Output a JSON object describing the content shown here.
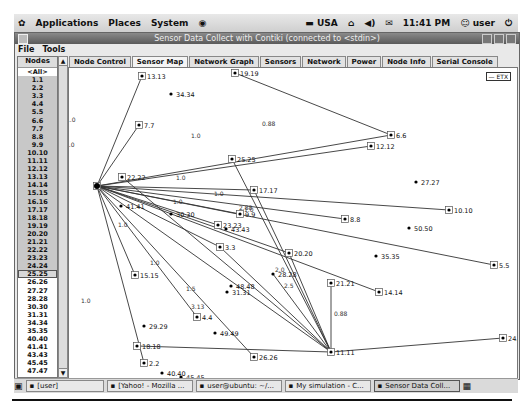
{
  "panel": {
    "menus": [
      "Applications",
      "Places",
      "System"
    ],
    "keyboard": "USA",
    "clock": "11:41 PM",
    "user": "user"
  },
  "window": {
    "title": "Sensor Data Collect with Contiki (connected to <stdin>)",
    "menu": [
      "File",
      "Tools"
    ]
  },
  "nodes": {
    "header": "Nodes",
    "items": [
      "<All>",
      "1.1",
      "2.2",
      "3.3",
      "4.4",
      "5.5",
      "6.6",
      "7.7",
      "8.8",
      "9.9",
      "10.10",
      "11.11",
      "12.12",
      "13.13",
      "14.14",
      "15.15",
      "16.16",
      "17.17",
      "18.18",
      "19.19",
      "20.20",
      "21.21",
      "22.22",
      "23.23",
      "24.24",
      "25.25",
      "26.26",
      "27.27",
      "28.28",
      "30.30",
      "31.31",
      "34.34",
      "35.35",
      "40.40",
      "41.41",
      "43.43",
      "45.45",
      "47.47"
    ],
    "selected_range": "1.1-24.24",
    "focused": "25.25"
  },
  "tabs": [
    "Node Control",
    "Sensor Map",
    "Network Graph",
    "Sensors",
    "Network",
    "Power",
    "Node Info",
    "Serial Console"
  ],
  "active_tab": "Sensor Map",
  "map": {
    "legend": "— ETX",
    "sink": "16.16",
    "nodes": [
      {
        "id": "13.13",
        "x": 73,
        "y": 8,
        "boxed": true
      },
      {
        "id": "19.19",
        "x": 166,
        "y": 5,
        "boxed": true
      },
      {
        "id": "34.34",
        "x": 102,
        "y": 26,
        "boxed": false
      },
      {
        "id": "7.7",
        "x": 70,
        "y": 57,
        "boxed": true
      },
      {
        "id": "6.6",
        "x": 322,
        "y": 67,
        "boxed": true
      },
      {
        "id": "12.12",
        "x": 302,
        "y": 78,
        "boxed": true
      },
      {
        "id": "25.25",
        "x": 163,
        "y": 91,
        "boxed": true
      },
      {
        "id": "22.22",
        "x": 53,
        "y": 109,
        "boxed": true
      },
      {
        "id": "16.16",
        "x": 28,
        "y": 118,
        "boxed": true
      },
      {
        "id": "27.27",
        "x": 347,
        "y": 114,
        "boxed": false
      },
      {
        "id": "17.17",
        "x": 185,
        "y": 122,
        "boxed": true
      },
      {
        "id": "10.10",
        "x": 380,
        "y": 142,
        "boxed": true
      },
      {
        "id": "41.41",
        "x": 52,
        "y": 138,
        "boxed": false
      },
      {
        "id": "30.30",
        "x": 102,
        "y": 146,
        "boxed": false
      },
      {
        "id": "9.9",
        "x": 171,
        "y": 146,
        "boxed": true
      },
      {
        "id": "8.8",
        "x": 276,
        "y": 151,
        "boxed": true
      },
      {
        "id": "23.23",
        "x": 149,
        "y": 157,
        "boxed": true
      },
      {
        "id": "43.43",
        "x": 157,
        "y": 161,
        "boxed": false
      },
      {
        "id": "50.50",
        "x": 340,
        "y": 160,
        "boxed": false
      },
      {
        "id": "3.3",
        "x": 151,
        "y": 179,
        "boxed": true
      },
      {
        "id": "20.20",
        "x": 220,
        "y": 185,
        "boxed": true
      },
      {
        "id": "35.35",
        "x": 307,
        "y": 188,
        "boxed": false
      },
      {
        "id": "5.5",
        "x": 425,
        "y": 197,
        "boxed": true
      },
      {
        "id": "28.28",
        "x": 204,
        "y": 206,
        "boxed": false
      },
      {
        "id": "15.15",
        "x": 66,
        "y": 207,
        "boxed": true
      },
      {
        "id": "48.48",
        "x": 162,
        "y": 218,
        "boxed": false
      },
      {
        "id": "21.21",
        "x": 262,
        "y": 215,
        "boxed": true
      },
      {
        "id": "31.31",
        "x": 158,
        "y": 224,
        "boxed": false
      },
      {
        "id": "14.14",
        "x": 310,
        "y": 224,
        "boxed": true
      },
      {
        "id": "4.4",
        "x": 128,
        "y": 249,
        "boxed": true
      },
      {
        "id": "20.20b",
        "label": "29.29",
        "x": 75,
        "y": 258,
        "boxed": false
      },
      {
        "id": "49.49",
        "x": 146,
        "y": 265,
        "boxed": false
      },
      {
        "id": "24.24",
        "x": 434,
        "y": 270,
        "boxed": true
      },
      {
        "id": "18.18",
        "x": 68,
        "y": 278,
        "boxed": true
      },
      {
        "id": "11.11",
        "x": 262,
        "y": 284,
        "boxed": true
      },
      {
        "id": "26.26",
        "x": 185,
        "y": 289,
        "boxed": true
      },
      {
        "id": "2.2",
        "x": 75,
        "y": 295,
        "boxed": true
      },
      {
        "id": "40.40",
        "x": 93,
        "y": 305,
        "boxed": false
      },
      {
        "id": "45.45",
        "x": 112,
        "y": 309,
        "boxed": false
      },
      {
        "id": "47.47",
        "x": 58,
        "y": 313,
        "boxed": false
      }
    ],
    "edges": [
      {
        "from": "16.16",
        "to": "13.13",
        "label": "1.0",
        "lx": 50,
        "ly": 88
      },
      {
        "from": "16.16",
        "to": "7.7",
        "label": "1.0",
        "lx": 49,
        "ly": 113
      },
      {
        "from": "19.19",
        "to": "6.6",
        "label": "0.88",
        "lx": 246,
        "ly": 92
      },
      {
        "from": "16.16",
        "to": "6.6",
        "label": "",
        "lx": 0,
        "ly": 0
      },
      {
        "from": "16.16",
        "to": "12.12",
        "label": "",
        "lx": 0,
        "ly": 0
      },
      {
        "from": "16.16",
        "to": "17.17",
        "label": "1.0",
        "lx": 160,
        "ly": 146
      },
      {
        "from": "16.16",
        "to": "10.10",
        "label": "1.0",
        "lx": 198,
        "ly": 162
      },
      {
        "from": "16.16",
        "to": "9.9",
        "label": "1.0",
        "lx": 157,
        "ly": 170
      },
      {
        "from": "16.16",
        "to": "8.8",
        "label": "1.0",
        "lx": 228,
        "ly": 178
      },
      {
        "from": "16.16",
        "to": "5.5",
        "label": "1.0",
        "lx": 0,
        "ly": 0
      },
      {
        "from": "16.16",
        "to": "23.23",
        "label": "1.0",
        "lx": 102,
        "ly": 193
      },
      {
        "from": "16.16",
        "to": "3.3",
        "label": "1.0",
        "lx": 134,
        "ly": 231
      },
      {
        "from": "16.16",
        "to": "20.20",
        "label": "1.0",
        "lx": 0,
        "ly": 0
      },
      {
        "from": "16.16",
        "to": "14.14",
        "label": "1.0",
        "lx": 0,
        "ly": 0
      },
      {
        "from": "16.16",
        "to": "15.15",
        "label": "1.0",
        "lx": 65,
        "ly": 269
      },
      {
        "from": "16.16",
        "to": "4.4",
        "label": "1.5",
        "lx": 170,
        "ly": 257
      },
      {
        "from": "16.16",
        "to": "11.11",
        "label": "",
        "lx": 0,
        "ly": 0
      },
      {
        "from": "16.16",
        "to": "26.26",
        "label": "",
        "lx": 0,
        "ly": 0
      },
      {
        "from": "16.16",
        "to": "2.2",
        "label": "1.0",
        "lx": 0,
        "ly": 0
      },
      {
        "from": "22.22",
        "to": "11.11",
        "label": "",
        "lx": 0,
        "ly": 0
      },
      {
        "from": "25.25",
        "to": "11.11",
        "label": "1.0",
        "lx": 175,
        "ly": 104
      },
      {
        "from": "21.21",
        "to": "11.11",
        "label": "2.5",
        "lx": 268,
        "ly": 254
      },
      {
        "from": "20.20",
        "to": "11.11",
        "label": "2.0",
        "lx": 259,
        "ly": 238
      },
      {
        "from": "17.17",
        "to": "11.11",
        "label": "2.88",
        "lx": 223,
        "ly": 176
      },
      {
        "from": "18.18",
        "to": "11.11",
        "label": "3.13",
        "lx": 175,
        "ly": 275
      },
      {
        "from": "11.11",
        "to": "24.24",
        "label": "0.88",
        "lx": 318,
        "ly": 282
      },
      {
        "from": "28.28",
        "to": "11.11",
        "label": "2.75",
        "lx": 0,
        "ly": 0
      },
      {
        "from": "3.3",
        "to": "11.11",
        "label": "1.75",
        "lx": 0,
        "ly": 0
      }
    ]
  },
  "taskbar": {
    "items": [
      "[user]",
      "[Yahoo! - Mozilla ...",
      "user@ubuntu: ~/...",
      "My simulation - C...",
      "Sensor Data Coll..."
    ],
    "active": "Sensor Data Coll..."
  }
}
